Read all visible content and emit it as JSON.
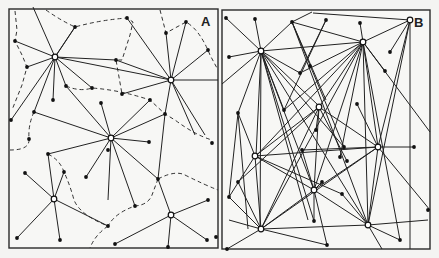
{
  "figure": {
    "panels": [
      {
        "label": "A",
        "frame": {
          "x": 9,
          "y": 9,
          "w": 209,
          "h": 239
        },
        "label_pos": {
          "x": 201,
          "y": 26
        },
        "hubs": [
          {
            "id": "h1",
            "x": 55,
            "y": 57
          },
          {
            "id": "h2",
            "x": 171,
            "y": 80
          },
          {
            "id": "h3",
            "x": 111,
            "y": 138
          },
          {
            "id": "h4",
            "x": 54,
            "y": 199
          },
          {
            "id": "h5",
            "x": 171,
            "y": 215
          }
        ],
        "leaves": [
          {
            "x": 15,
            "y": 41
          },
          {
            "x": 75,
            "y": 27
          },
          {
            "x": 127,
            "y": 18
          },
          {
            "x": 166,
            "y": 33
          },
          {
            "x": 186,
            "y": 22
          },
          {
            "x": 208,
            "y": 50
          },
          {
            "x": 27,
            "y": 67
          },
          {
            "x": 116,
            "y": 60
          },
          {
            "x": 92,
            "y": 88
          },
          {
            "x": 66,
            "y": 86
          },
          {
            "x": 53,
            "y": 100
          },
          {
            "x": 34,
            "y": 112
          },
          {
            "x": 11,
            "y": 120
          },
          {
            "x": 122,
            "y": 94
          },
          {
            "x": 101,
            "y": 103
          },
          {
            "x": 150,
            "y": 100
          },
          {
            "x": 165,
            "y": 114
          },
          {
            "x": 212,
            "y": 143
          },
          {
            "x": 149,
            "y": 142
          },
          {
            "x": 108,
            "y": 150
          },
          {
            "x": 48,
            "y": 154
          },
          {
            "x": 29,
            "y": 139
          },
          {
            "x": 86,
            "y": 177
          },
          {
            "x": 135,
            "y": 206
          },
          {
            "x": 158,
            "y": 179
          },
          {
            "x": 25,
            "y": 173
          },
          {
            "x": 64,
            "y": 172
          },
          {
            "x": 17,
            "y": 238
          },
          {
            "x": 60,
            "y": 240
          },
          {
            "x": 108,
            "y": 226
          },
          {
            "x": 115,
            "y": 244
          },
          {
            "x": 208,
            "y": 200
          },
          {
            "x": 207,
            "y": 240
          },
          {
            "x": 168,
            "y": 247
          },
          {
            "x": 216,
            "y": 237
          }
        ],
        "edges": [
          [
            55,
            57,
            15,
            41
          ],
          [
            55,
            57,
            33,
            7
          ],
          [
            55,
            57,
            75,
            27
          ],
          [
            55,
            57,
            27,
            67
          ],
          [
            55,
            57,
            92,
            88
          ],
          [
            55,
            57,
            66,
            86
          ],
          [
            55,
            57,
            53,
            100
          ],
          [
            55,
            57,
            34,
            112
          ],
          [
            55,
            57,
            11,
            120
          ],
          [
            55,
            57,
            116,
            60
          ],
          [
            55,
            57,
            171,
            80
          ],
          [
            75,
            27,
            55,
            57
          ],
          [
            171,
            80,
            127,
            18
          ],
          [
            171,
            80,
            166,
            33
          ],
          [
            171,
            80,
            186,
            22
          ],
          [
            171,
            80,
            208,
            50
          ],
          [
            171,
            80,
            116,
            60
          ],
          [
            171,
            80,
            122,
            94
          ],
          [
            171,
            80,
            218,
            80
          ],
          [
            171,
            80,
            165,
            114
          ],
          [
            171,
            80,
            205,
            135
          ],
          [
            171,
            80,
            195,
            135
          ],
          [
            111,
            138,
            34,
            112
          ],
          [
            111,
            138,
            66,
            86
          ],
          [
            111,
            138,
            101,
            103
          ],
          [
            111,
            138,
            150,
            100
          ],
          [
            111,
            138,
            165,
            114
          ],
          [
            111,
            138,
            149,
            142
          ],
          [
            111,
            138,
            108,
            200
          ],
          [
            111,
            138,
            135,
            206
          ],
          [
            111,
            138,
            86,
            177
          ],
          [
            111,
            138,
            48,
            154
          ],
          [
            111,
            138,
            158,
            179
          ],
          [
            54,
            199,
            48,
            154
          ],
          [
            54,
            199,
            25,
            173
          ],
          [
            54,
            199,
            64,
            172
          ],
          [
            54,
            199,
            17,
            238
          ],
          [
            54,
            199,
            60,
            240
          ],
          [
            54,
            199,
            108,
            226
          ],
          [
            171,
            215,
            158,
            179
          ],
          [
            171,
            215,
            208,
            200
          ],
          [
            171,
            215,
            207,
            240
          ],
          [
            171,
            215,
            168,
            247
          ],
          [
            171,
            215,
            115,
            244
          ],
          [
            158,
            179,
            165,
            114
          ]
        ],
        "boundaries": [
          "M 15 11 L 17 30 L 15 41 L 22 55 L 27 67 L 22 85 L 12 110",
          "M 46 10 Q 60 20 75 27 Q 100 20 127 18 L 133 22 L 130 35 L 122 60 L 116 60 L 122 94",
          "M 160 10 L 166 33 L 186 22 Q 200 30 210 55 L 218 70",
          "M 66 86 Q 80 92 92 88 Q 120 90 150 100 L 165 114 L 175 120 Q 195 135 212 140",
          "M 34 112 Q 28 125 29 139 Q 30 150 10 150",
          "M 48 154 Q 60 160 64 172 Q 70 185 74 200 Q 80 215 108 226",
          "M 158 179 L 152 195 Q 148 205 135 206 Q 115 213 108 226",
          "M 158 179 Q 175 170 185 175 Q 205 185 218 190",
          "M 108 226 Q 95 235 90 248"
        ]
      },
      {
        "label": "B",
        "frame": {
          "x": 222,
          "y": 10,
          "w": 208,
          "h": 239
        },
        "label_pos": {
          "x": 414,
          "y": 27
        },
        "hubs": [
          {
            "id": "b1",
            "x": 261,
            "y": 51
          },
          {
            "id": "b2",
            "x": 363,
            "y": 42
          },
          {
            "id": "b3",
            "x": 410,
            "y": 20
          },
          {
            "id": "b4",
            "x": 319,
            "y": 107
          },
          {
            "id": "b5",
            "x": 255,
            "y": 156
          },
          {
            "id": "b6",
            "x": 378,
            "y": 147
          },
          {
            "id": "b7",
            "x": 314,
            "y": 190
          },
          {
            "id": "b8",
            "x": 261,
            "y": 229
          },
          {
            "id": "b9",
            "x": 368,
            "y": 225
          }
        ],
        "leaves": [
          {
            "x": 226,
            "y": 18
          },
          {
            "x": 255,
            "y": 19
          },
          {
            "x": 292,
            "y": 22
          },
          {
            "x": 326,
            "y": 20
          },
          {
            "x": 360,
            "y": 23
          },
          {
            "x": 229,
            "y": 57
          },
          {
            "x": 300,
            "y": 73
          },
          {
            "x": 310,
            "y": 66
          },
          {
            "x": 390,
            "y": 52
          },
          {
            "x": 385,
            "y": 71
          },
          {
            "x": 238,
            "y": 113
          },
          {
            "x": 284,
            "y": 110
          },
          {
            "x": 316,
            "y": 130
          },
          {
            "x": 357,
            "y": 104
          },
          {
            "x": 302,
            "y": 150
          },
          {
            "x": 344,
            "y": 147
          },
          {
            "x": 340,
            "y": 157
          },
          {
            "x": 347,
            "y": 161
          },
          {
            "x": 322,
            "y": 182
          },
          {
            "x": 414,
            "y": 147
          },
          {
            "x": 229,
            "y": 197
          },
          {
            "x": 238,
            "y": 182
          },
          {
            "x": 314,
            "y": 221
          },
          {
            "x": 342,
            "y": 194
          },
          {
            "x": 327,
            "y": 245
          },
          {
            "x": 400,
            "y": 240
          },
          {
            "x": 428,
            "y": 210
          },
          {
            "x": 227,
            "y": 249
          }
        ],
        "edges": [
          [
            261,
            51,
            226,
            18
          ],
          [
            261,
            51,
            255,
            19
          ],
          [
            261,
            51,
            292,
            22
          ],
          [
            261,
            51,
            229,
            57
          ],
          [
            261,
            51,
            300,
            73
          ],
          [
            261,
            51,
            363,
            42
          ],
          [
            261,
            51,
            222,
            84
          ],
          [
            261,
            51,
            238,
            113
          ],
          [
            261,
            51,
            260,
            229
          ],
          [
            261,
            51,
            256,
            156
          ],
          [
            261,
            51,
            284,
            110
          ],
          [
            261,
            51,
            314,
            190
          ],
          [
            261,
            51,
            344,
            147
          ],
          [
            261,
            51,
            368,
            225
          ],
          [
            261,
            51,
            314,
            221
          ],
          [
            261,
            51,
            318,
            105
          ],
          [
            261,
            51,
            308,
            220
          ],
          [
            292,
            22,
            312,
            12
          ],
          [
            292,
            22,
            363,
            42
          ],
          [
            292,
            22,
            326,
            100
          ],
          [
            292,
            22,
            344,
            147
          ],
          [
            292,
            22,
            368,
            225
          ],
          [
            326,
            20,
            284,
            110
          ],
          [
            326,
            20,
            300,
            73
          ],
          [
            363,
            42,
            360,
            23
          ],
          [
            363,
            42,
            410,
            20
          ],
          [
            363,
            42,
            300,
            73
          ],
          [
            363,
            42,
            385,
            71
          ],
          [
            363,
            42,
            256,
            156
          ],
          [
            363,
            42,
            261,
            229
          ],
          [
            363,
            42,
            284,
            110
          ],
          [
            363,
            42,
            314,
            190
          ],
          [
            363,
            42,
            340,
            157
          ],
          [
            363,
            42,
            319,
            107
          ],
          [
            363,
            42,
            368,
            225
          ],
          [
            363,
            42,
            378,
            147
          ],
          [
            363,
            42,
            400,
            240
          ],
          [
            363,
            42,
            430,
            132
          ],
          [
            410,
            20,
            313,
            13
          ],
          [
            410,
            20,
            390,
            52
          ],
          [
            410,
            20,
            378,
            147
          ],
          [
            410,
            20,
            368,
            225
          ],
          [
            410,
            20,
            410,
            249
          ],
          [
            319,
            107,
            238,
            182
          ],
          [
            319,
            107,
            261,
            229
          ],
          [
            319,
            107,
            255,
            156
          ],
          [
            319,
            107,
            316,
            130
          ],
          [
            319,
            107,
            378,
            147
          ],
          [
            319,
            107,
            314,
            190
          ],
          [
            319,
            107,
            347,
            161
          ],
          [
            255,
            156,
            238,
            113
          ],
          [
            255,
            156,
            378,
            147
          ],
          [
            255,
            156,
            261,
            229
          ],
          [
            255,
            156,
            314,
            190
          ],
          [
            255,
            156,
            342,
            194
          ],
          [
            255,
            156,
            229,
            197
          ],
          [
            378,
            147,
            414,
            147
          ],
          [
            378,
            147,
            368,
            225
          ],
          [
            378,
            147,
            261,
            229
          ],
          [
            378,
            147,
            314,
            190
          ],
          [
            378,
            147,
            302,
            150
          ],
          [
            378,
            147,
            430,
            210
          ],
          [
            378,
            147,
            357,
            104
          ],
          [
            314,
            190,
            302,
            150
          ],
          [
            314,
            190,
            261,
            229
          ],
          [
            314,
            190,
            368,
            225
          ],
          [
            314,
            190,
            322,
            182
          ],
          [
            314,
            190,
            314,
            221
          ],
          [
            314,
            190,
            327,
            245
          ],
          [
            261,
            229,
            229,
            197
          ],
          [
            261,
            229,
            238,
            182
          ],
          [
            261,
            229,
            368,
            225
          ],
          [
            261,
            229,
            327,
            245
          ],
          [
            261,
            229,
            227,
            249
          ],
          [
            261,
            229,
            229,
            220
          ],
          [
            368,
            225,
            400,
            240
          ],
          [
            368,
            225,
            382,
            249
          ],
          [
            368,
            225,
            428,
            220
          ],
          [
            368,
            225,
            342,
            194
          ],
          [
            238,
            113,
            229,
            197
          ],
          [
            238,
            113,
            248,
            229
          ]
        ]
      }
    ]
  }
}
